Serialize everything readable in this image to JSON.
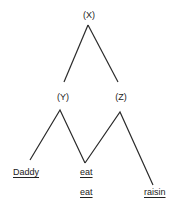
{
  "nodes": {
    "x": {
      "label": "(X)"
    },
    "y": {
      "label": "(Y)"
    },
    "z": {
      "label": "(Z)"
    }
  },
  "words": [
    {
      "text": "Daddy"
    },
    {
      "text": "eat"
    },
    {
      "text": "eat"
    },
    {
      "text": "raisin"
    }
  ],
  "colors": {
    "line": "#2a2a2a",
    "text": "#222222",
    "background": "#ffffff"
  }
}
